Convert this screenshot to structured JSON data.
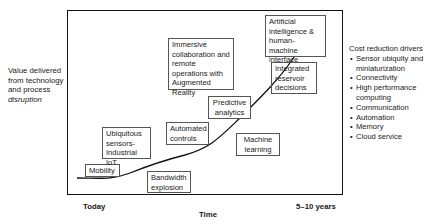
{
  "y_axis_label": {
    "line1": "Value delivered",
    "line2": "from technology",
    "line3": "and process",
    "line4_italic": "disruption"
  },
  "x_axis": {
    "start_label": "Today",
    "end_label": "5–10 years",
    "title": "Time"
  },
  "milestones": [
    {
      "id": "mobility",
      "label": "Mobility"
    },
    {
      "id": "ubiquitous-sensors",
      "label": "Ubiquitous sensors- Industrial IoT"
    },
    {
      "id": "bandwidth-explosion",
      "label": "Bandwidth explosion"
    },
    {
      "id": "automated-controls",
      "label": "Automated controls"
    },
    {
      "id": "predictive-analytics",
      "label": "Predictive analytics"
    },
    {
      "id": "machine-learning",
      "label": "Machine learning"
    },
    {
      "id": "immersive-collaboration",
      "label": "Immersive collaboration and remote operations with Augmented Reality"
    },
    {
      "id": "integrated-reservoir",
      "label": "Integrated reservoir decisions"
    },
    {
      "id": "artificial-intelligence",
      "label": "Artificial intelligence & human-machine interface"
    }
  ],
  "cost_reduction": {
    "title": "Cost reduction drivers",
    "items": [
      "Sensor ubiquity and miniaturization",
      "Connectivity",
      "High performance computing",
      "Communication",
      "Automation",
      "Memory",
      "Cloud service"
    ]
  },
  "colors": {
    "line": "#111111",
    "box_border": "#555555",
    "text": "#1a1a1a"
  }
}
